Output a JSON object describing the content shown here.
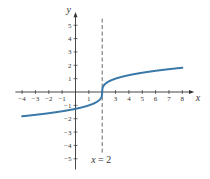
{
  "chart_data": {
    "type": "line",
    "title": "",
    "xlabel": "x",
    "ylabel": "y",
    "xlim": [
      -4.5,
      8.8
    ],
    "ylim": [
      -5.8,
      5.8
    ],
    "x_ticks": [
      -4,
      -3,
      -2,
      -1,
      1,
      2,
      3,
      4,
      5,
      6,
      7,
      8
    ],
    "x_tick_labels": [
      "−4",
      "−3",
      "−2",
      "−1",
      "1",
      "",
      "3",
      "4",
      "5",
      "6",
      "7",
      "8"
    ],
    "y_ticks": [
      -5,
      -4,
      -3,
      -2,
      -1,
      1,
      2,
      3,
      4,
      5
    ],
    "y_tick_labels": [
      "−5",
      "−4",
      "−3",
      "−2",
      "−1",
      "1",
      "2",
      "3",
      "4",
      "5"
    ],
    "grid": false,
    "series": [
      {
        "name": "y = ∛(x − 2)",
        "color": "#3a78a8",
        "x": [
          -4,
          -3,
          -2,
          -1,
          0,
          1,
          1.5,
          1.9,
          2,
          2.1,
          2.5,
          3,
          4,
          5,
          6,
          7,
          8
        ],
        "y": [
          -1.82,
          -1.71,
          -1.59,
          -1.44,
          -1.26,
          -1.0,
          -0.79,
          -0.46,
          0,
          0.46,
          0.79,
          1.0,
          1.26,
          1.44,
          1.59,
          1.71,
          1.82
        ]
      }
    ],
    "annotations": [
      {
        "type": "vertical-asymptote-dashed",
        "x": 2,
        "label": "x = 2"
      }
    ]
  },
  "labels": {
    "x_axis": "x",
    "y_axis": "y",
    "asymptote": "x = 2"
  }
}
